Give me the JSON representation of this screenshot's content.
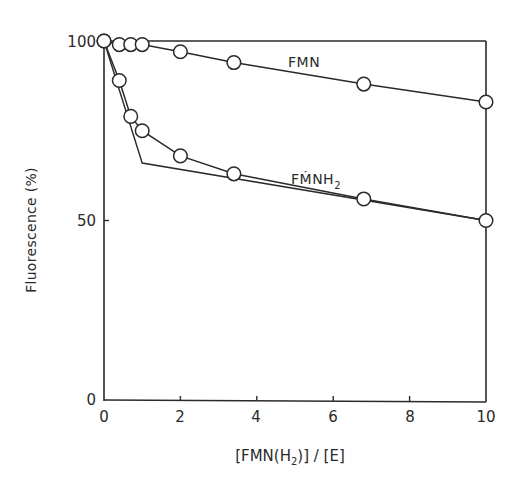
{
  "chart_data": {
    "type": "line",
    "title": "",
    "xlabel": "[FMN(H2)] / [E]",
    "ylabel": "Fluorescence (%)",
    "xlim": [
      0,
      10
    ],
    "ylim": [
      0,
      100
    ],
    "x_ticks": [
      0,
      2,
      4,
      6,
      8,
      10
    ],
    "y_ticks": [
      0,
      50,
      100
    ],
    "grid": false,
    "legend": "inline labels",
    "series": [
      {
        "name": "FMN",
        "marker": "open-circle",
        "x": [
          0,
          0.4,
          0.7,
          1.0,
          2.0,
          3.4,
          6.8,
          10
        ],
        "y": [
          100,
          99,
          99,
          99,
          97,
          94,
          88,
          83
        ]
      },
      {
        "name": "FMNH2",
        "marker": "open-circle",
        "x": [
          0,
          0.4,
          0.7,
          1.0,
          2.0,
          3.4,
          6.8,
          10
        ],
        "y": [
          100,
          89,
          79,
          75,
          68,
          63,
          56,
          50
        ]
      }
    ],
    "annotations": [
      {
        "type": "reference-line",
        "description": "horizontal line at 100% across the plot",
        "points": [
          [
            0,
            100
          ],
          [
            10,
            100
          ]
        ]
      },
      {
        "type": "tangent-lines",
        "description": "extrapolated titration lines for FMNH2 intersecting near x=1.0",
        "points": [
          [
            0,
            100
          ],
          [
            1.0,
            66
          ],
          [
            10,
            50
          ]
        ]
      }
    ]
  },
  "labels": {
    "y_title": "Fluorescence (%)",
    "x_title_pre": "[FMN(H",
    "x_title_sub": "2",
    "x_title_post": ")] / [E]",
    "fmn": "FMN",
    "fmnh2_main": "FṀNH",
    "fmnh2_sub": "2",
    "x_ticks": [
      "0",
      "2",
      "4",
      "6",
      "8",
      "10"
    ],
    "y_ticks": [
      "0",
      "50",
      "100"
    ]
  },
  "colors": {
    "ink": "#2a2a2a",
    "background": "#ffffff"
  }
}
